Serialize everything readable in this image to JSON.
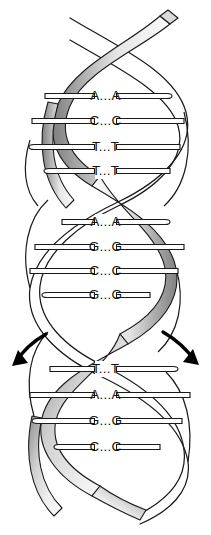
{
  "figure": {
    "name": "dna-double-helix",
    "width": 211,
    "height": 535,
    "background_color": "#ffffff",
    "stroke_color": "#1a1a1a",
    "ribbon_dark": "#8a8a8a",
    "ribbon_mid": "#bdbdbd",
    "ribbon_light": "#f2f2f2",
    "rung_fill": "#ffffff"
  },
  "base_pair_groups": [
    {
      "group_name": "upper-turn",
      "rungs": [
        {
          "label": "A...A",
          "y": 96,
          "x_left": 45,
          "x_right": 172,
          "style": "capped-right"
        },
        {
          "label": "C...C",
          "y": 121,
          "x_left": 32,
          "x_right": 184,
          "style": "flat"
        },
        {
          "label": "T...T",
          "y": 147,
          "x_left": 29,
          "x_right": 180,
          "style": "capped-left"
        },
        {
          "label": "T...T",
          "y": 171,
          "x_left": 44,
          "x_right": 170,
          "style": "capped-left"
        }
      ]
    },
    {
      "group_name": "middle-turn",
      "rungs": [
        {
          "label": "A...A",
          "y": 222,
          "x_left": 62,
          "x_right": 170,
          "style": "capped-right"
        },
        {
          "label": "G...G",
          "y": 247,
          "x_left": 35,
          "x_right": 184,
          "style": "flat"
        },
        {
          "label": "C...C",
          "y": 271,
          "x_left": 30,
          "x_right": 178,
          "style": "flat"
        },
        {
          "label": "G...G",
          "y": 295,
          "x_left": 42,
          "x_right": 150,
          "style": "capped-left"
        }
      ]
    },
    {
      "group_name": "lower-turn",
      "rungs": [
        {
          "label": "T...T",
          "y": 369,
          "x_left": 50,
          "x_right": 178,
          "style": "capped-right"
        },
        {
          "label": "A...A",
          "y": 395,
          "x_left": 30,
          "x_right": 190,
          "style": "flat"
        },
        {
          "label": "G...G",
          "y": 421,
          "x_left": 32,
          "x_right": 182,
          "style": "capped-left"
        },
        {
          "label": "C...C",
          "y": 447,
          "x_left": 54,
          "x_right": 160,
          "style": "capped-left"
        }
      ]
    }
  ],
  "annotations": {
    "left_arrow": {
      "name": "unwinding-arrow-left",
      "direction": "down-left"
    },
    "right_arrow": {
      "name": "unwinding-arrow-right",
      "direction": "down-right"
    }
  },
  "chart_data": {
    "type": "diagram",
    "sequence_top_to_bottom": [
      "A...A",
      "C...C",
      "T...T",
      "T...T",
      "A...A",
      "G...G",
      "C...C",
      "G...G",
      "T...T",
      "A...A",
      "G...G",
      "C...C"
    ],
    "turns": 3,
    "rungs_per_turn": 4,
    "annotations": [
      "curved arrow left (down-left)",
      "curved arrow right (down-right)"
    ]
  }
}
